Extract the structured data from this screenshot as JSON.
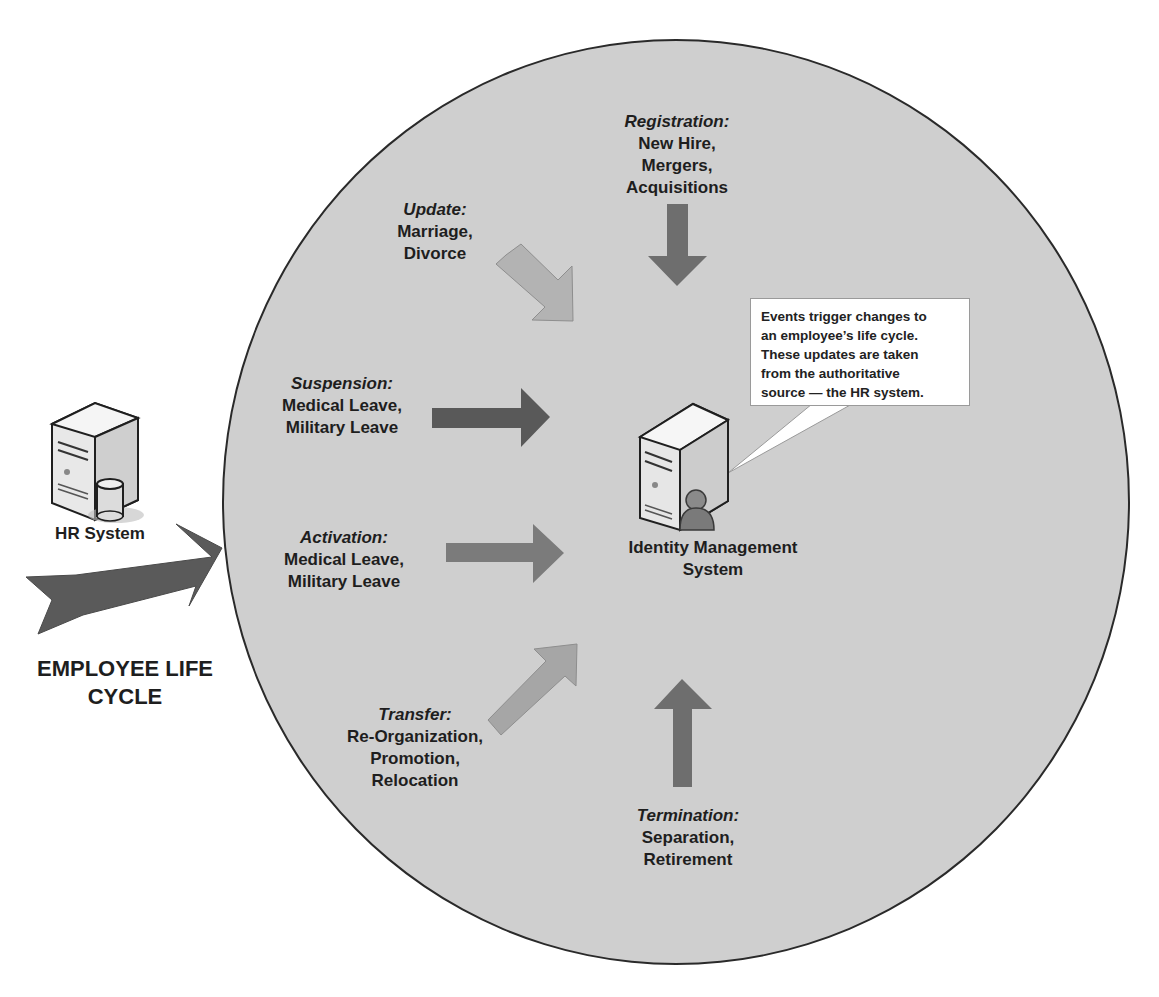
{
  "diagram": {
    "title": "EMPLOYEE LIFE CYCLE",
    "title_lines": [
      "EMPLOYEE LIFE",
      "CYCLE"
    ],
    "colors": {
      "circle_fill": "#cfcfcf",
      "circle_border": "#2a2a2a",
      "arrow_dark": "#595959",
      "arrow_mid": "#7a7a7a",
      "arrow_light": "#a9a9a9",
      "callout_bg": "#ffffff"
    },
    "hr_system": {
      "label": "HR System",
      "icon": "server-database-icon"
    },
    "identity_system": {
      "label_lines": [
        "Identity Management",
        "System"
      ],
      "icon": "server-user-icon"
    },
    "callout": {
      "lines": [
        "Events trigger changes to",
        "an employee’s life cycle.",
        "These updates are taken",
        "from the authoritative",
        "source — the HR system."
      ]
    },
    "events": [
      {
        "category": "Registration:",
        "items": [
          "New Hire,",
          "Mergers,",
          "Acquisitions"
        ],
        "arrow": "down"
      },
      {
        "category": "Update:",
        "items": [
          "Marriage,",
          "Divorce"
        ],
        "arrow": "down-right"
      },
      {
        "category": "Suspension:",
        "items": [
          "Medical Leave,",
          "Military Leave"
        ],
        "arrow": "right"
      },
      {
        "category": "Activation:",
        "items": [
          "Medical Leave,",
          "Military Leave"
        ],
        "arrow": "right"
      },
      {
        "category": "Transfer:",
        "items": [
          "Re-Organization,",
          "Promotion,",
          "Relocation"
        ],
        "arrow": "up-right"
      },
      {
        "category": "Termination:",
        "items": [
          "Separation,",
          "Retirement"
        ],
        "arrow": "up"
      }
    ]
  }
}
